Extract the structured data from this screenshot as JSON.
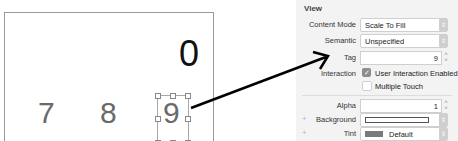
{
  "canvas": {
    "display_value": "0",
    "buttons": [
      "7",
      "8",
      "9"
    ],
    "selected_button": "9"
  },
  "inspector": {
    "section_title": "View",
    "content_mode": {
      "label": "Content Mode",
      "value": "Scale To Fill"
    },
    "semantic": {
      "label": "Semantic",
      "value": "Unspecified"
    },
    "tag": {
      "label": "Tag",
      "value": "9"
    },
    "interaction": {
      "label": "Interaction",
      "user_interaction_enabled": {
        "label": "User Interaction Enabled",
        "checked": true
      },
      "multiple_touch": {
        "label": "Multiple Touch",
        "checked": false
      }
    },
    "alpha": {
      "label": "Alpha",
      "value": "1"
    },
    "background": {
      "label": "Background",
      "value": ""
    },
    "tint": {
      "label": "Tint",
      "value": "Default"
    }
  },
  "colors": {
    "panel_bg": "#f3f3f3",
    "arrow": "#000000",
    "tint_swatch": "#7a7a7a"
  }
}
